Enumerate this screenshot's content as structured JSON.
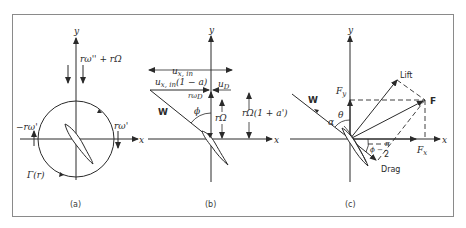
{
  "figure": {
    "panels": [
      {
        "id": "a",
        "caption": "(a)",
        "axis_x": "x",
        "axis_y": "y",
        "labels": {
          "top_velocity": "rω'' + rΩ",
          "left_velocity": "−rω'",
          "right_velocity": "rω'",
          "circulation": "Γ(r)"
        }
      },
      {
        "id": "b",
        "caption": "(b)",
        "axis_x": "x",
        "axis_y": "y",
        "labels": {
          "u_in": "u",
          "u_in_sub": "x, in",
          "u_in_reduced": "u",
          "u_in_reduced_sub": "x, in",
          "u_in_reduced_factor": "(1 − a)",
          "u_d": "u",
          "u_d_sub": "D",
          "r_omega_d": "rω",
          "r_omega_d_sub": "D",
          "relative_velocity": "W",
          "phi": "ϕ",
          "r_Omega": "rΩ",
          "r_Omega_total": "rΩ(1 + a')"
        }
      },
      {
        "id": "c",
        "caption": "(c)",
        "axis_x": "x",
        "axis_y": "y",
        "labels": {
          "lift": "Lift",
          "force": "F",
          "f_y": "F",
          "f_y_sub": "y",
          "f_x": "F",
          "f_x_sub": "x",
          "relative_velocity": "W",
          "theta": "θ",
          "alpha": "α",
          "drag": "Drag",
          "angle_phi_minus": "ϕ −",
          "pi_over_2_num": "π",
          "pi_over_2_den": "2"
        }
      }
    ]
  }
}
